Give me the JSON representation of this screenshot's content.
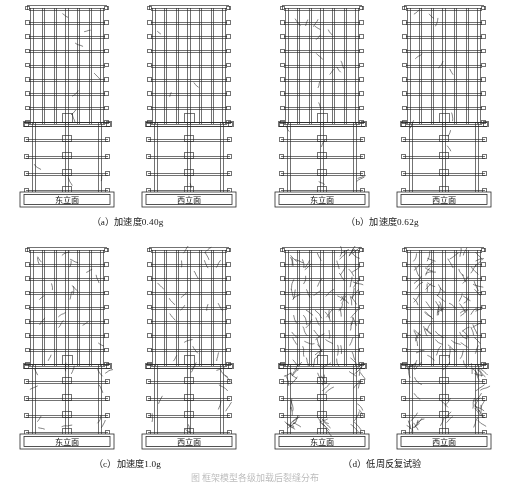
{
  "figure": {
    "type": "engineering-elevation-damage-diagram",
    "master_caption": "图 框架模型各级加载后裂缝分布",
    "panels": [
      {
        "id": "a",
        "label": "（a）加速度0.40g",
        "index_label": "（a）",
        "condition": "加速度0.40g",
        "elevations": [
          {
            "name": "东立面",
            "side": "east",
            "damage_level": "light"
          },
          {
            "name": "西立面",
            "side": "west",
            "damage_level": "very-light"
          }
        ]
      },
      {
        "id": "b",
        "label": "（b）加速度0.62g",
        "index_label": "（b）",
        "condition": "加速度0.62g",
        "elevations": [
          {
            "name": "东立面",
            "side": "east",
            "damage_level": "light-moderate"
          },
          {
            "name": "西立面",
            "side": "west",
            "damage_level": "light"
          }
        ]
      },
      {
        "id": "c",
        "label": "（c）加速度1.0g",
        "index_label": "（c）",
        "condition": "加速度1.0g",
        "elevations": [
          {
            "name": "东立面",
            "side": "east",
            "damage_level": "moderate"
          },
          {
            "name": "西立面",
            "side": "west",
            "damage_level": "moderate"
          }
        ]
      },
      {
        "id": "d",
        "label": "（d）低周反复试验",
        "index_label": "（d）",
        "condition": "低周反复试验",
        "elevations": [
          {
            "name": "东立面",
            "side": "east",
            "damage_level": "severe"
          },
          {
            "name": "西立面",
            "side": "west",
            "damage_level": "severe"
          }
        ]
      }
    ],
    "structure": {
      "upper_frame_stories": 8,
      "upper_frame_bays": 6,
      "lower_frame_stories": 4,
      "lower_frame_columns": 3,
      "foundation_block_label_font": "song",
      "line_color": "#2a2a2a",
      "crack_color": "#1e1e1e",
      "background": "#ffffff"
    }
  }
}
